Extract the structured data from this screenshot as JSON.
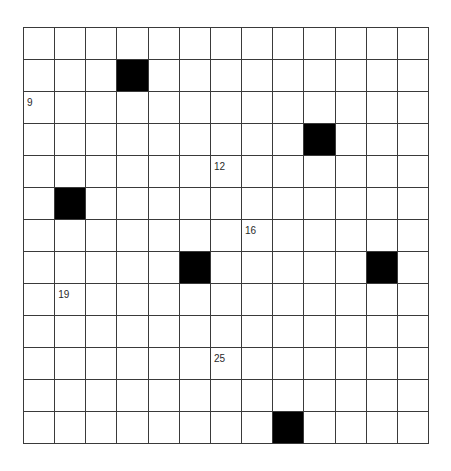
{
  "puzzle": {
    "rows": 13,
    "cols": 13,
    "blocks": [
      [
        1,
        3
      ],
      [
        3,
        9
      ],
      [
        5,
        1
      ],
      [
        7,
        5
      ],
      [
        7,
        11
      ],
      [
        12,
        8
      ]
    ],
    "numbers": [
      {
        "row": 2,
        "col": 0,
        "label": "9"
      },
      {
        "row": 4,
        "col": 6,
        "label": "12"
      },
      {
        "row": 6,
        "col": 7,
        "label": "16"
      },
      {
        "row": 8,
        "col": 1,
        "label": "19"
      },
      {
        "row": 10,
        "col": 6,
        "label": "25"
      }
    ],
    "colors": {
      "block": "#000000",
      "cell": "#ffffff",
      "line": "#3a3a3a",
      "number": "#2a2a2a"
    }
  }
}
